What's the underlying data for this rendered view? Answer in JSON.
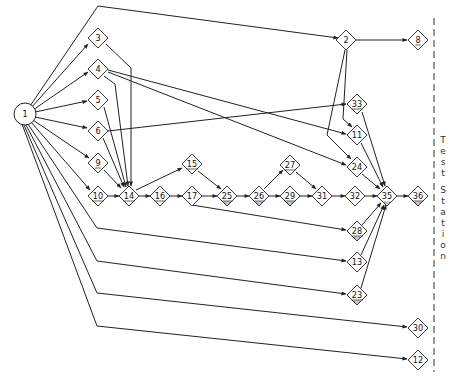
{
  "diagram": {
    "type": "network-flow",
    "start_node": {
      "id": "1",
      "shape": "circle",
      "x": 25,
      "y": 114
    },
    "nodes": [
      {
        "id": "3",
        "x": 98,
        "y": 38,
        "underline": false
      },
      {
        "id": "4",
        "x": 98,
        "y": 69,
        "underline": false
      },
      {
        "id": "5",
        "x": 98,
        "y": 100,
        "underline": false
      },
      {
        "id": "6",
        "x": 98,
        "y": 131,
        "underline": false
      },
      {
        "id": "9",
        "x": 98,
        "y": 163,
        "underline": true
      },
      {
        "id": "10",
        "x": 98,
        "y": 196,
        "underline": true
      },
      {
        "id": "14",
        "x": 129,
        "y": 196,
        "underline": true
      },
      {
        "id": "15",
        "x": 192,
        "y": 164,
        "underline": true
      },
      {
        "id": "16",
        "x": 160,
        "y": 196,
        "underline": true
      },
      {
        "id": "17",
        "x": 192,
        "y": 196,
        "underline": false
      },
      {
        "id": "25",
        "x": 227,
        "y": 196,
        "underline": true
      },
      {
        "id": "26",
        "x": 259,
        "y": 196,
        "underline": true
      },
      {
        "id": "27",
        "x": 290,
        "y": 165,
        "underline": true
      },
      {
        "id": "29",
        "x": 290,
        "y": 196,
        "underline": true
      },
      {
        "id": "31",
        "x": 322,
        "y": 196,
        "underline": false
      },
      {
        "id": "32",
        "x": 355,
        "y": 196,
        "underline": false
      },
      {
        "id": "35",
        "x": 387,
        "y": 196,
        "underline": false
      },
      {
        "id": "36",
        "x": 418,
        "y": 196,
        "underline": true
      },
      {
        "id": "2",
        "x": 346,
        "y": 40,
        "underline": false
      },
      {
        "id": "8",
        "x": 418,
        "y": 40,
        "underline": true
      },
      {
        "id": "33",
        "x": 357,
        "y": 104,
        "underline": true
      },
      {
        "id": "11",
        "x": 357,
        "y": 135,
        "underline": false
      },
      {
        "id": "24",
        "x": 357,
        "y": 167,
        "underline": false
      },
      {
        "id": "28",
        "x": 357,
        "y": 231,
        "underline": true
      },
      {
        "id": "13",
        "x": 357,
        "y": 262,
        "underline": false
      },
      {
        "id": "23",
        "x": 357,
        "y": 295,
        "underline": true
      },
      {
        "id": "30",
        "x": 418,
        "y": 328,
        "underline": false
      },
      {
        "id": "12",
        "x": 418,
        "y": 360,
        "underline": false
      }
    ],
    "edges": [
      {
        "from": "1",
        "to": "2",
        "points": [
          [
            30,
            106
          ],
          [
            98,
            6
          ],
          [
            338,
            38
          ]
        ]
      },
      {
        "from": "1",
        "to": "3",
        "points": [
          [
            31,
            108
          ],
          [
            88,
            44
          ]
        ]
      },
      {
        "from": "1",
        "to": "4",
        "points": [
          [
            33,
            110
          ],
          [
            88,
            72
          ]
        ]
      },
      {
        "from": "1",
        "to": "5",
        "points": [
          [
            35,
            112
          ],
          [
            87,
            101
          ]
        ]
      },
      {
        "from": "1",
        "to": "6",
        "points": [
          [
            35,
            117
          ],
          [
            87,
            128
          ]
        ]
      },
      {
        "from": "1",
        "to": "9",
        "points": [
          [
            33,
            120
          ],
          [
            89,
            158
          ]
        ]
      },
      {
        "from": "1",
        "to": "10",
        "points": [
          [
            31,
            122
          ],
          [
            90,
            190
          ]
        ]
      },
      {
        "from": "1",
        "to": "13",
        "points": [
          [
            28,
            124
          ],
          [
            97,
            228
          ],
          [
            346,
            261
          ]
        ]
      },
      {
        "from": "1",
        "to": "23",
        "points": [
          [
            26,
            125
          ],
          [
            97,
            261
          ],
          [
            346,
            294
          ]
        ]
      },
      {
        "from": "1",
        "to": "30",
        "points": [
          [
            24,
            125
          ],
          [
            97,
            293
          ],
          [
            407,
            327
          ]
        ]
      },
      {
        "from": "1",
        "to": "12",
        "points": [
          [
            22,
            124
          ],
          [
            97,
            326
          ],
          [
            407,
            359
          ]
        ]
      },
      {
        "from": "3",
        "to": "14",
        "points": [
          [
            106,
            44
          ],
          [
            131,
            68
          ],
          [
            131,
            186
          ]
        ]
      },
      {
        "from": "4",
        "to": "14",
        "points": [
          [
            104,
            76
          ],
          [
            115,
            84
          ],
          [
            128,
            186
          ]
        ]
      },
      {
        "from": "5",
        "to": "14",
        "points": [
          [
            104,
            107
          ],
          [
            126,
            187
          ]
        ]
      },
      {
        "from": "6",
        "to": "14",
        "points": [
          [
            103,
            138
          ],
          [
            124,
            187
          ]
        ]
      },
      {
        "from": "9",
        "to": "14",
        "points": [
          [
            104,
            170
          ],
          [
            121,
            188
          ]
        ]
      },
      {
        "from": "10",
        "to": "14",
        "points": [
          [
            108,
            196
          ],
          [
            119,
            196
          ]
        ]
      },
      {
        "from": "4",
        "to": "11",
        "points": [
          [
            108,
            70
          ],
          [
            346,
            134
          ]
        ]
      },
      {
        "from": "4",
        "to": "24",
        "points": [
          [
            108,
            72
          ],
          [
            346,
            165
          ]
        ]
      },
      {
        "from": "6",
        "to": "33",
        "points": [
          [
            108,
            131
          ],
          [
            346,
            104
          ]
        ]
      },
      {
        "from": "2",
        "to": "8",
        "points": [
          [
            356,
            40
          ],
          [
            407,
            40
          ]
        ]
      },
      {
        "from": "2",
        "to": "11",
        "points": [
          [
            347,
            50
          ],
          [
            343,
            119
          ],
          [
            352,
            127
          ]
        ]
      },
      {
        "from": "2",
        "to": "24",
        "points": [
          [
            345,
            50
          ],
          [
            327,
            135
          ],
          [
            351,
            159
          ]
        ]
      },
      {
        "from": "33",
        "to": "35",
        "points": [
          [
            362,
            112
          ],
          [
            385,
            186
          ]
        ]
      },
      {
        "from": "11",
        "to": "35",
        "points": [
          [
            361,
            143
          ],
          [
            383,
            187
          ]
        ]
      },
      {
        "from": "24",
        "to": "35",
        "points": [
          [
            362,
            174
          ],
          [
            380,
            189
          ]
        ]
      },
      {
        "from": "14",
        "to": "15",
        "points": [
          [
            136,
            190
          ],
          [
            182,
            168
          ]
        ]
      },
      {
        "from": "14",
        "to": "16",
        "points": [
          [
            139,
            196
          ],
          [
            150,
            196
          ]
        ]
      },
      {
        "from": "16",
        "to": "17",
        "points": [
          [
            170,
            196
          ],
          [
            182,
            196
          ]
        ]
      },
      {
        "from": "15",
        "to": "25",
        "points": [
          [
            198,
            171
          ],
          [
            221,
            189
          ]
        ]
      },
      {
        "from": "17",
        "to": "25",
        "points": [
          [
            202,
            196
          ],
          [
            217,
            196
          ]
        ]
      },
      {
        "from": "17",
        "to": "28",
        "points": [
          [
            192,
            205
          ],
          [
            346,
            230
          ]
        ]
      },
      {
        "from": "25",
        "to": "26",
        "points": [
          [
            237,
            196
          ],
          [
            249,
            196
          ]
        ]
      },
      {
        "from": "26",
        "to": "27",
        "points": [
          [
            264,
            189
          ],
          [
            283,
            170
          ]
        ]
      },
      {
        "from": "26",
        "to": "29",
        "points": [
          [
            269,
            196
          ],
          [
            280,
            196
          ]
        ]
      },
      {
        "from": "27",
        "to": "31",
        "points": [
          [
            296,
            172
          ],
          [
            316,
            189
          ]
        ]
      },
      {
        "from": "29",
        "to": "31",
        "points": [
          [
            300,
            196
          ],
          [
            312,
            196
          ]
        ]
      },
      {
        "from": "31",
        "to": "32",
        "points": [
          [
            332,
            196
          ],
          [
            345,
            196
          ]
        ]
      },
      {
        "from": "32",
        "to": "35",
        "points": [
          [
            365,
            196
          ],
          [
            377,
            196
          ]
        ]
      },
      {
        "from": "35",
        "to": "36",
        "points": [
          [
            397,
            196
          ],
          [
            408,
            196
          ]
        ]
      },
      {
        "from": "28",
        "to": "35",
        "points": [
          [
            362,
            225
          ],
          [
            381,
            203
          ]
        ]
      },
      {
        "from": "13",
        "to": "35",
        "points": [
          [
            361,
            255
          ],
          [
            384,
            205
          ]
        ]
      },
      {
        "from": "23",
        "to": "35",
        "points": [
          [
            361,
            288
          ],
          [
            386,
            205
          ]
        ]
      }
    ],
    "markers": [
      {
        "under": "25"
      },
      {
        "under": "26"
      },
      {
        "under": "28"
      },
      {
        "under": "35"
      },
      {
        "under": "36"
      },
      {
        "under": "23"
      },
      {
        "under": "29"
      }
    ],
    "test_station": {
      "label_letters": [
        "T",
        "e",
        "s",
        "t",
        "",
        "S",
        "t",
        "a",
        "t",
        "i",
        "o",
        "n"
      ],
      "line_x": 434
    }
  },
  "caption": {
    "text": "Figure (partially cut off)"
  }
}
